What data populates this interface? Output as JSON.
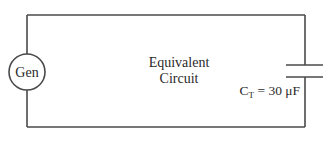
{
  "diagram": {
    "type": "circuit",
    "title_line1": "Equivalent",
    "title_line2": "Circuit",
    "source": {
      "label": "Gen",
      "icon": "generator-icon"
    },
    "capacitor": {
      "symbol": "C",
      "subscript": "T",
      "equals": " = ",
      "value": "30 μF",
      "icon": "capacitor-icon"
    },
    "colors": {
      "wire": "#4a4a4a",
      "text": "#2a2a2a",
      "background": "#ffffff"
    }
  }
}
